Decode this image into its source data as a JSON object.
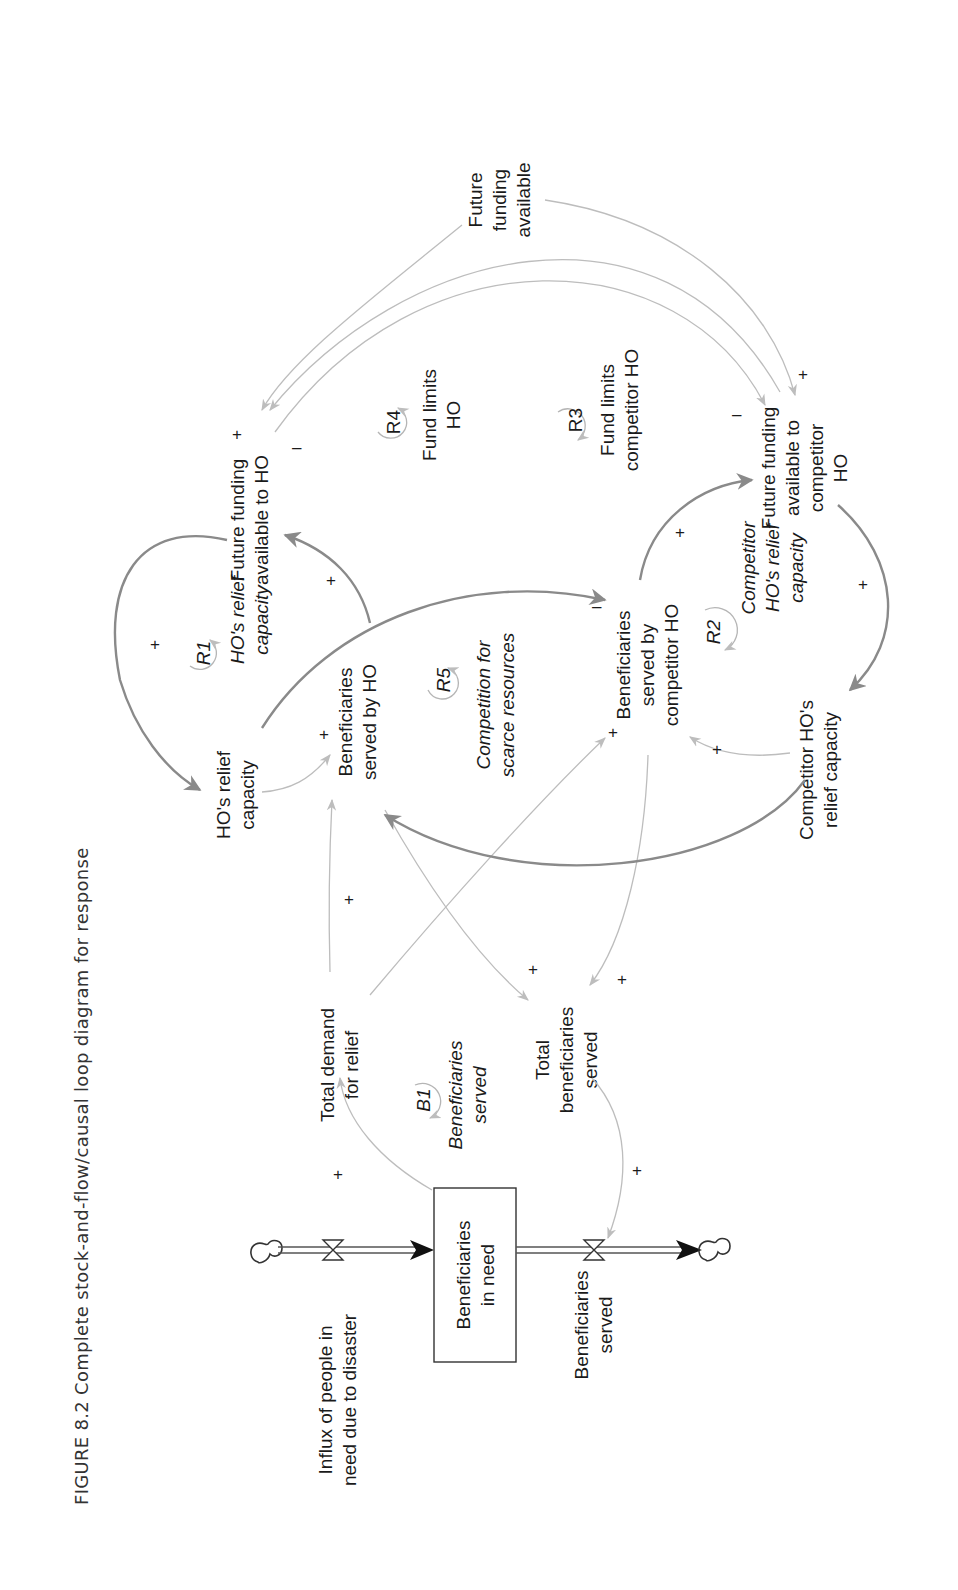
{
  "caption": "FIGURE 8.2  Complete stock-and-flow/causal loop diagram for response",
  "colors": {
    "light_link": "#bdbdbd",
    "dark_link": "#8a8a8a",
    "text": "#1a1a1a",
    "stock_border": "#333333"
  },
  "stock": {
    "label_line1": "Beneficiaries",
    "label_line2": "in need"
  },
  "flows": {
    "inflow": {
      "line1": "Influx of people in",
      "line2": "need due to disaster"
    },
    "outflow": {
      "line1": "Beneficiaries",
      "line2": "served"
    }
  },
  "variables": {
    "total_demand": {
      "line1": "Total demand",
      "line2": "for relief"
    },
    "total_served": {
      "line1": "Total",
      "line2": "beneficiaries",
      "line3": "served"
    },
    "ho_capacity": {
      "line1": "HO's relief",
      "line2": "capacity"
    },
    "served_by_ho": {
      "line1": "Beneficiaries",
      "line2": "served by HO"
    },
    "funding_ho": {
      "line1": "Future funding",
      "line2": "available to HO"
    },
    "served_by_comp": {
      "line1": "Beneficiaries",
      "line2": "served by",
      "line3": "competitor HO"
    },
    "comp_capacity": {
      "line1": "Competitor HO's",
      "line2": "relief capacity"
    },
    "funding_comp": {
      "line1": "Future funding",
      "line2": "available to",
      "line3": "competitor",
      "line4": "HO"
    },
    "funding_total": {
      "line1": "Future",
      "line2": "funding",
      "line3": "available"
    }
  },
  "loops": {
    "B1": {
      "id": "B1",
      "line1": "Beneficiaries",
      "line2": "served"
    },
    "R1": {
      "id": "R1",
      "line1": "HO's relief",
      "line2": "capacity"
    },
    "R2": {
      "id": "R2",
      "line1": "Competitor",
      "line2": "HO's relief",
      "line3": "capacity"
    },
    "R3": {
      "id": "R3",
      "line1": "Fund limits",
      "line2": "competitor HO"
    },
    "R4": {
      "id": "R4",
      "line1": "Fund limits",
      "line2": "HO"
    },
    "R5": {
      "id": "R5",
      "line1": "Competition for",
      "line2": "scarce resources"
    }
  },
  "polarity": {
    "plus": "+",
    "minus": "–"
  }
}
